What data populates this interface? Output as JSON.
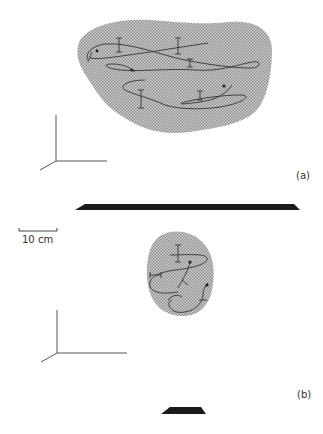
{
  "figure": {
    "panels": [
      {
        "id": "a",
        "label": "(a)",
        "description": "Large stippled region with several looping tracks and error bars above a long dark platform"
      },
      {
        "id": "b",
        "label": "(b)",
        "description": "Small stippled region with a few looping tracks above a short dark platform"
      }
    ],
    "scale_bar": {
      "label": "10 cm"
    },
    "colors": {
      "stipple": "#b8b8b8",
      "track": "#333333",
      "platform": "#1a1a1a",
      "axes": "#555555"
    }
  }
}
